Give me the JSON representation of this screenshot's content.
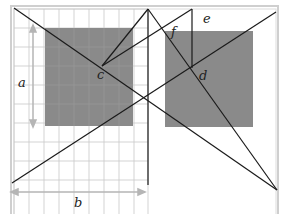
{
  "diagram": {
    "title": "",
    "colors": {
      "background": "#ffffff",
      "frame": "#c9c9c9",
      "grid": "#c8c8c8",
      "gray_rect": "#8a8a8a",
      "line": "#1a1a1a",
      "arrow": "#b5b5b5",
      "label": "#222222"
    },
    "labels": {
      "a": "a",
      "b": "b",
      "c": "c",
      "d": "d",
      "e": "e",
      "f": "f"
    },
    "frame": {
      "outer": [
        11,
        6,
        278,
        246
      ],
      "inner": [
        14,
        9,
        275,
        243
      ]
    },
    "grid_region": [
      14,
      9,
      148,
      230
    ],
    "gray_rects": [
      {
        "name": "left-panel",
        "x": 45,
        "y": 28,
        "w": 88,
        "h": 98
      },
      {
        "name": "right-panel",
        "x": 165,
        "y": 31,
        "w": 88,
        "h": 96
      }
    ],
    "points": {
      "c": [
        102,
        66
      ],
      "d": [
        192,
        68
      ],
      "apex": [
        148,
        9
      ],
      "e_top": [
        192,
        11
      ]
    }
  }
}
